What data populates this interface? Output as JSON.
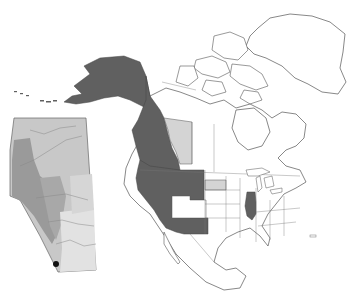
{
  "figure": {
    "type": "species-distribution-map",
    "width": 357,
    "height": 293
  },
  "colors": {
    "background": "#ffffff",
    "outline": "#555555",
    "range_present": "#606060",
    "range_peripheral": "#d4d4d4",
    "land": "#ffffff",
    "inset_base": "#c8c8c8",
    "inset_dark": "#9a9a9a",
    "inset_mid": "#b4b4b4",
    "inset_light": "#e2e2e2",
    "locality_marker": "#111111"
  },
  "legend": {
    "range_present_label": "",
    "range_peripheral_label": ""
  },
  "regions": {
    "dark_filled": [
      "Alaska",
      "Yukon",
      "British Columbia",
      "Washington",
      "Oregon",
      "California",
      "Idaho",
      "Nevada",
      "Montana",
      "Wyoming",
      "Utah (west)",
      "Arizona",
      "New Mexico",
      "Illinois"
    ],
    "light_filled": [
      "Alberta",
      "South Dakota"
    ],
    "unfilled": [
      "Colorado",
      "Utah (east)",
      "rest of North America",
      "Greenland",
      "Canadian Arctic",
      "Mexico"
    ]
  },
  "inset": {
    "name": "Alberta",
    "position": {
      "x": 8,
      "y": 118,
      "w": 90,
      "h": 160
    },
    "marker": {
      "x": 56,
      "y": 274,
      "r": 3
    }
  }
}
